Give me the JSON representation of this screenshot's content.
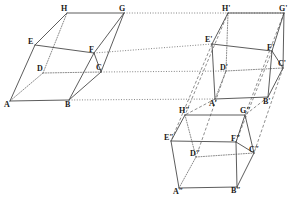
{
  "figure": {
    "background": "#ffffff",
    "stroke_color": "#4a4a4a",
    "hidden_stroke_color": "#6b6b6b",
    "width": 296,
    "height": 197
  },
  "solids": [
    {
      "name": "solid-1",
      "label_suffix": "",
      "vertices": {
        "A": {
          "x": 10,
          "y": 101,
          "label": "A",
          "lx": 4,
          "ly": 107
        },
        "B": {
          "x": 69,
          "y": 100,
          "label": "B",
          "lx": 65,
          "ly": 107
        },
        "C": {
          "x": 101,
          "y": 72,
          "label": "C",
          "lx": 96,
          "ly": 70
        },
        "D": {
          "x": 43,
          "y": 73,
          "label": "D",
          "lx": 37,
          "ly": 71
        },
        "E": {
          "x": 35,
          "y": 45,
          "label": "E",
          "lx": 28,
          "ly": 44
        },
        "F": {
          "x": 94,
          "y": 53,
          "label": "F",
          "lx": 89,
          "ly": 52
        },
        "G": {
          "x": 124,
          "y": 13,
          "label": "G",
          "lx": 119,
          "ly": 11
        },
        "H": {
          "x": 67,
          "y": 13,
          "label": "H",
          "lx": 61,
          "ly": 11
        }
      }
    },
    {
      "name": "solid-2",
      "label_suffix": "'",
      "vertices": {
        "A": {
          "x": 215,
          "y": 99,
          "label": "A'",
          "lx": 209,
          "ly": 106
        },
        "B": {
          "x": 268,
          "y": 97,
          "label": "B'",
          "lx": 263,
          "ly": 104
        },
        "C": {
          "x": 283,
          "y": 68,
          "label": "C'",
          "lx": 278,
          "ly": 66
        },
        "D": {
          "x": 226,
          "y": 71,
          "label": "D'",
          "lx": 220,
          "ly": 70
        },
        "E": {
          "x": 212,
          "y": 44,
          "label": "E'",
          "lx": 205,
          "ly": 42
        },
        "F": {
          "x": 272,
          "y": 51,
          "label": "F'",
          "lx": 267,
          "ly": 50
        },
        "G": {
          "x": 284,
          "y": 13,
          "label": "G'",
          "lx": 279,
          "ly": 11
        },
        "H": {
          "x": 228,
          "y": 13,
          "label": "H'",
          "lx": 222,
          "ly": 11
        }
      }
    },
    {
      "name": "solid-3",
      "label_suffix": "″",
      "vertices": {
        "A": {
          "x": 179,
          "y": 188,
          "label": "A″",
          "lx": 173,
          "ly": 194
        },
        "B": {
          "x": 237,
          "y": 187,
          "label": "B″",
          "lx": 231,
          "ly": 193
        },
        "C": {
          "x": 254,
          "y": 153,
          "label": "C″",
          "lx": 249,
          "ly": 152
        },
        "D": {
          "x": 196,
          "y": 157,
          "label": "D″",
          "lx": 190,
          "ly": 156
        },
        "E": {
          "x": 171,
          "y": 141,
          "label": "E″",
          "lx": 164,
          "ly": 140
        },
        "F": {
          "x": 236,
          "y": 142,
          "label": "F″",
          "lx": 231,
          "ly": 141
        },
        "G": {
          "x": 245,
          "y": 115,
          "label": "G″",
          "lx": 240,
          "ly": 113
        },
        "H": {
          "x": 185,
          "y": 115,
          "label": "H″",
          "lx": 179,
          "ly": 113
        }
      }
    }
  ],
  "edges": {
    "visible": [
      [
        "A",
        "B"
      ],
      [
        "B",
        "C"
      ],
      [
        "C",
        "G"
      ],
      [
        "G",
        "H"
      ],
      [
        "H",
        "E"
      ],
      [
        "E",
        "A"
      ],
      [
        "E",
        "F"
      ],
      [
        "F",
        "G"
      ],
      [
        "F",
        "B"
      ],
      [
        "F",
        "C"
      ]
    ],
    "hidden": [
      [
        "A",
        "D"
      ],
      [
        "D",
        "C"
      ],
      [
        "D",
        "H"
      ]
    ]
  },
  "projections": {
    "dotted_1_to_2": [
      [
        "G",
        "G"
      ],
      [
        "F",
        "E"
      ],
      [
        "C",
        "D"
      ],
      [
        "B",
        "A"
      ]
    ],
    "dashed_2_to_3": [
      [
        "A",
        "H"
      ],
      [
        "B",
        "G"
      ],
      [
        "E",
        "E"
      ],
      [
        "H",
        "H"
      ],
      [
        "D",
        "D"
      ],
      [
        "C",
        "C"
      ],
      [
        "F",
        "F"
      ],
      [
        "G",
        "G"
      ]
    ]
  }
}
